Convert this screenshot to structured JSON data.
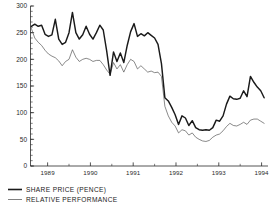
{
  "chart_data": {
    "type": "line",
    "title": "",
    "subtitle": "",
    "xlabel": "",
    "ylabel": "",
    "xlim": [
      1988.6,
      1994.15
    ],
    "ylim": [
      0,
      300
    ],
    "yticks": [
      0,
      50,
      100,
      150,
      200,
      250,
      300
    ],
    "ytick_labels": [
      "0",
      "50",
      "100",
      "150",
      "200",
      "250",
      "300"
    ],
    "y_minor_tick_step": 10,
    "xticks": [
      1989,
      1990,
      1991,
      1992,
      1993,
      1994
    ],
    "xtick_labels": [
      "1989",
      "1990",
      "1991",
      "1992",
      "1993",
      "1994"
    ],
    "x_minor_ticks": [
      1989.5,
      1990.5,
      1991.5,
      1992.5,
      1993.5
    ],
    "grid": false,
    "legend_position": "below-left",
    "series": [
      {
        "name": "SHARE  PRICE  (PENCE)",
        "style": "thick",
        "color": "#1a1a1a",
        "x": [
          1988.62,
          1988.7,
          1988.78,
          1988.86,
          1988.94,
          1989.02,
          1989.1,
          1989.18,
          1989.26,
          1989.34,
          1989.42,
          1989.5,
          1989.58,
          1989.66,
          1989.74,
          1989.82,
          1989.9,
          1989.98,
          1990.06,
          1990.14,
          1990.22,
          1990.3,
          1990.38,
          1990.46,
          1990.54,
          1990.62,
          1990.7,
          1990.78,
          1990.86,
          1990.94,
          1991.02,
          1991.1,
          1991.18,
          1991.26,
          1991.34,
          1991.42,
          1991.5,
          1991.58,
          1991.66,
          1991.74,
          1991.82,
          1991.9,
          1991.98,
          1992.06,
          1992.14,
          1992.22,
          1992.3,
          1992.38,
          1992.46,
          1992.54,
          1992.62,
          1992.7,
          1992.78,
          1992.86,
          1992.94,
          1993.02,
          1993.1,
          1993.18,
          1993.26,
          1993.34,
          1993.42,
          1993.5,
          1993.58,
          1993.66,
          1993.74,
          1993.82,
          1993.9,
          1993.98,
          1994.06
        ],
        "values": [
          262,
          266,
          262,
          264,
          247,
          243,
          246,
          275,
          238,
          228,
          232,
          250,
          288,
          250,
          238,
          246,
          262,
          247,
          238,
          250,
          264,
          255,
          216,
          170,
          214,
          196,
          212,
          194,
          226,
          252,
          267,
          243,
          248,
          244,
          250,
          245,
          240,
          228,
          192,
          128,
          122,
          110,
          96,
          78,
          94,
          90,
          76,
          85,
          72,
          68,
          67,
          68,
          67,
          72,
          86,
          84,
          94,
          116,
          131,
          126,
          125,
          127,
          141,
          130,
          168,
          157,
          148,
          141,
          128
        ]
      },
      {
        "name": "RELATIVE  PERFORMANCE",
        "style": "thin",
        "color": "#4a4a4a",
        "x": [
          1988.62,
          1988.7,
          1988.78,
          1988.86,
          1988.94,
          1989.02,
          1989.1,
          1989.18,
          1989.26,
          1989.34,
          1989.42,
          1989.5,
          1989.58,
          1989.66,
          1989.74,
          1989.82,
          1989.9,
          1989.98,
          1990.06,
          1990.14,
          1990.22,
          1990.3,
          1990.38,
          1990.46,
          1990.54,
          1990.62,
          1990.7,
          1990.78,
          1990.86,
          1990.94,
          1991.02,
          1991.1,
          1991.18,
          1991.26,
          1991.34,
          1991.42,
          1991.5,
          1991.58,
          1991.66,
          1991.74,
          1991.82,
          1991.9,
          1991.98,
          1992.06,
          1992.14,
          1992.22,
          1992.3,
          1992.38,
          1992.46,
          1992.54,
          1992.62,
          1992.7,
          1992.78,
          1992.86,
          1992.94,
          1993.02,
          1993.1,
          1993.18,
          1993.26,
          1993.34,
          1993.42,
          1993.5,
          1993.58,
          1993.66,
          1993.74,
          1993.82,
          1993.9,
          1993.98,
          1994.06
        ],
        "values": [
          258,
          240,
          232,
          226,
          217,
          210,
          206,
          203,
          197,
          188,
          196,
          200,
          218,
          204,
          196,
          200,
          202,
          200,
          196,
          198,
          198,
          190,
          180,
          172,
          194,
          182,
          190,
          176,
          190,
          200,
          196,
          182,
          188,
          182,
          176,
          178,
          175,
          176,
          168,
          112,
          94,
          82,
          75,
          62,
          68,
          66,
          58,
          62,
          54,
          50,
          47,
          46,
          48,
          54,
          58,
          60,
          66,
          74,
          80,
          76,
          75,
          78,
          82,
          78,
          86,
          88,
          88,
          84,
          80
        ]
      }
    ]
  },
  "legend": {
    "entries": [
      {
        "label": "SHARE  PRICE  (PENCE)"
      },
      {
        "label": "RELATIVE  PERFORMANCE"
      }
    ]
  }
}
